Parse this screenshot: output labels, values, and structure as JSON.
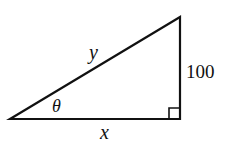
{
  "diagram": {
    "type": "right-triangle",
    "labels": {
      "hypotenuse": "y",
      "opposite": "100",
      "adjacent": "x",
      "angle": "θ"
    },
    "right_angle_marker": true,
    "stroke_color": "#111111",
    "background": "#ffffff"
  }
}
